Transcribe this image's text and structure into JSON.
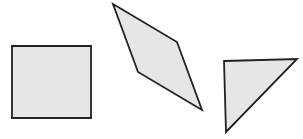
{
  "canvas": {
    "width": 303,
    "height": 139,
    "background": "#ffffff"
  },
  "style": {
    "fill": "#e6e6e6",
    "stroke": "#222222",
    "stroke_width": 1.8
  },
  "shapes": [
    {
      "name": "square",
      "kind": "square",
      "points": "12,46 91,46 91,118 12,118"
    },
    {
      "name": "rhombus",
      "kind": "rhombus",
      "points": "113,4 177,42 202,110 138,72"
    },
    {
      "name": "triangle",
      "kind": "right-triangle",
      "points": "224,61 297,59 226,132"
    }
  ]
}
